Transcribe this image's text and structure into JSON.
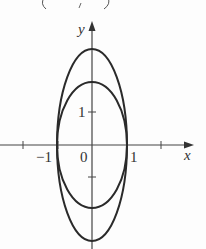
{
  "header_fragment": {
    "text": "(    ,    )"
  },
  "axes": {
    "x_label": "x",
    "y_label": "y",
    "x_ticks": [
      {
        "value": -2,
        "label": ""
      },
      {
        "value": -1,
        "label": "−1"
      },
      {
        "value": 1,
        "label": "1"
      },
      {
        "value": 2,
        "label": ""
      }
    ],
    "y_ticks": [
      {
        "value": 1,
        "label": "1"
      },
      {
        "value": -1,
        "label": ""
      }
    ],
    "origin_label": "0"
  },
  "curves": [
    {
      "name": "outer-ellipse",
      "equation": "x^2 + y^2/9 = 1",
      "a": 1,
      "b": 3
    },
    {
      "name": "inner-ellipse",
      "equation": "x^2 + y^2/4 = 1",
      "a": 1,
      "b": 2
    }
  ],
  "colors": {
    "stroke": "#2a2a2a",
    "axis": "#444444",
    "background": "#fdfdfd"
  }
}
